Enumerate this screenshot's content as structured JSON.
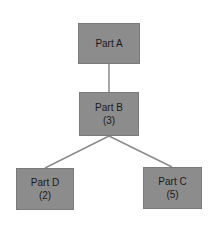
{
  "diagram": {
    "type": "tree",
    "nodes": [
      {
        "id": "a",
        "label": "Part A",
        "count": ""
      },
      {
        "id": "b",
        "label": "Part B",
        "count": "(3)"
      },
      {
        "id": "d",
        "label": "Part D",
        "count": "(2)"
      },
      {
        "id": "c",
        "label": "Part C",
        "count": "(5)"
      }
    ],
    "edges": [
      {
        "from": "a",
        "to": "b"
      },
      {
        "from": "b",
        "to": "d"
      },
      {
        "from": "b",
        "to": "c"
      }
    ],
    "colors": {
      "node_fill": "#8c8c8c",
      "edge": "#8a8a8a",
      "text": "#1a1a1a",
      "background": "#ffffff"
    }
  }
}
